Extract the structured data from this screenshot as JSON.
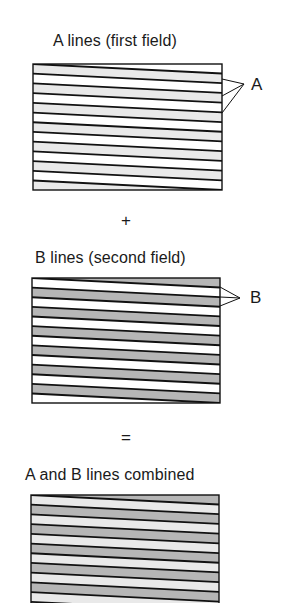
{
  "diagram": {
    "title_a": "A lines (first field)",
    "title_b": "B lines (second field)",
    "title_combined": "A and B lines combined",
    "plus_symbol": "+",
    "equals_symbol": "=",
    "pointer_a_label": "A",
    "pointer_b_label": "B"
  },
  "colors": {
    "line": "#111111",
    "white": "#ffffff",
    "light_grey": "#e9e9e9",
    "dark_grey": "#b6b6b6"
  },
  "fields": [
    {
      "id": "field-a",
      "box": {
        "x": 33,
        "y": 64,
        "w": 189,
        "h": 126
      },
      "band_pattern": [
        "light",
        "white"
      ],
      "pointer": {
        "label_key": "pointer_a_label",
        "apex": [
          244,
          84
        ],
        "targets_y": [
          79,
          96,
          113
        ]
      }
    },
    {
      "id": "field-b",
      "box": {
        "x": 32,
        "y": 278,
        "w": 188,
        "h": 125
      },
      "band_pattern": [
        "white",
        "dark"
      ],
      "pointer": {
        "label_key": "pointer_b_label",
        "apex": [
          240,
          298
        ],
        "targets_y": [
          287,
          297,
          306
        ]
      }
    },
    {
      "id": "field-combined",
      "box": {
        "x": 31,
        "y": 495,
        "w": 188,
        "h": 126
      },
      "band_pattern": [
        "light",
        "dark"
      ]
    }
  ],
  "stripes": {
    "line_count": 13,
    "slope_drop_px": 9.5,
    "line_width": 1.8
  }
}
